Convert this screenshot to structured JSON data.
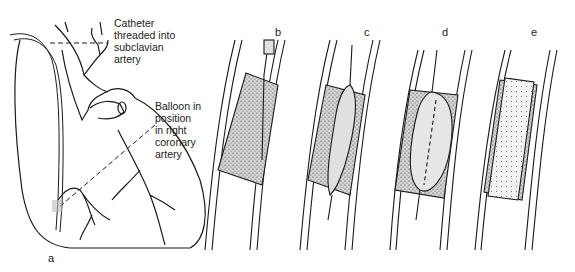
{
  "figure": {
    "panels": [
      {
        "id": "a",
        "letter": "a",
        "subject": "heart-with-catheter"
      },
      {
        "id": "b",
        "letter": "b",
        "subject": "catheter-approaching-plaque"
      },
      {
        "id": "c",
        "letter": "c",
        "subject": "balloon-inserted-into-plaque"
      },
      {
        "id": "d",
        "letter": "d",
        "subject": "balloon-inflated"
      },
      {
        "id": "e",
        "letter": "e",
        "subject": "artery-widened-after-procedure"
      }
    ],
    "annotations": {
      "catheter": [
        "Catheter",
        "threaded into",
        "subclavian",
        "artery"
      ],
      "balloon": [
        "Balloon in",
        "position",
        "in right",
        "coronary",
        "artery"
      ]
    },
    "colors": {
      "line": "#1a1a1a",
      "plaque_fill": "#bdbdbd",
      "balloon_fill": "#e6e6e6",
      "background": "#ffffff"
    }
  }
}
